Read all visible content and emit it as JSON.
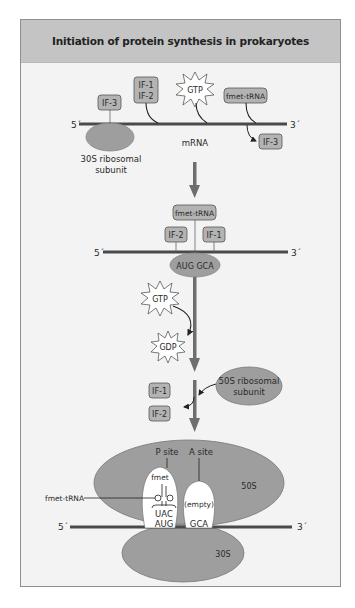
{
  "title": "Initiation of protein synthesis in prokaryotes",
  "colors": {
    "header_bg": "#c4c4c4",
    "panel_bg": "#f3f3f3",
    "factor_box": "#b3b3b3",
    "ribosome": "#9e9e9e",
    "arrow": "#6e6e6e",
    "mrna_line": "#4a4a4a"
  },
  "step1": {
    "five_prime": "5´",
    "three_prime": "3´",
    "mrna_label": "mRNA",
    "if3_label": "IF-3",
    "if1_label": "IF-1",
    "if2_label": "IF-2",
    "gtp_label": "GTP",
    "fmet_trna_label": "fmet-tRNA",
    "released_if3_label": "IF-3",
    "subunit_label_line1": "30S ribosomal",
    "subunit_label_line2": "subunit"
  },
  "step2": {
    "five_prime": "5´",
    "three_prime": "3´",
    "fmet_trna_label": "fmet-tRNA",
    "if2_label": "IF-2",
    "if1_label": "IF-1",
    "codon_label": "AUG GCA",
    "gtp_label": "GTP",
    "gdp_label": "GDP"
  },
  "step3": {
    "if1_label": "IF-1",
    "if2_label": "IF-2",
    "subunit_label_line1": "50S ribosomal",
    "subunit_label_line2": "subunit"
  },
  "step4": {
    "p_site_label": "P site",
    "a_site_label": "A site",
    "fmet_label": "fmet",
    "fmet_trna_label": "fmet-tRNA",
    "empty_label": "(empty)",
    "anticodon_label": "UAC",
    "p_codon_label": "AUG",
    "a_codon_label": "GCA",
    "large_subunit_label": "50S",
    "small_subunit_label": "30S",
    "five_prime": "5´",
    "three_prime": "3´"
  }
}
